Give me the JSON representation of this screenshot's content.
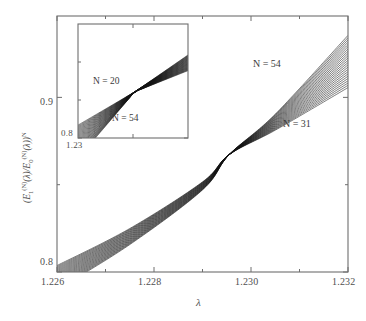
{
  "figure": {
    "type": "scientific-line-plot",
    "background": "#ffffff",
    "line_color": "#1a1a1a",
    "frame_color": "#6e6e6e"
  },
  "main_plot": {
    "xlabel": "λ",
    "ylabel_parts": {
      "open": "(E",
      "sub1": "1",
      "sup1": "(N)",
      "mid1": "(λ)/E",
      "sub2": "0",
      "sup2": "(N)",
      "mid2": "(λ))",
      "sup3": "N"
    },
    "ylabel_plain": "(E1(N)(λ)/E0(N)(λ))N",
    "x_ticks": [
      "1.226",
      "1.228",
      "1.230",
      "1.232"
    ],
    "y_ticks": [
      "0.9",
      "0.8"
    ],
    "annotations": [
      {
        "text": "N = 54",
        "position": "upper-right"
      },
      {
        "text": "N = 31",
        "position": "lower-right"
      }
    ]
  },
  "inset_plot": {
    "x_ticks": [
      "1.23"
    ],
    "y_ticks": [
      "0.8"
    ],
    "annotations": [
      {
        "text": "N = 20",
        "position": "left"
      },
      {
        "text": "N = 54",
        "position": "lower-center"
      }
    ]
  },
  "chart_data": {
    "type": "line",
    "title": "",
    "xlabel": "λ",
    "ylabel": "(E_1^(N)(λ)/E_0^(N)(λ))^N",
    "xlim": [
      1.226,
      1.232
    ],
    "ylim": [
      0.8,
      0.9466
    ],
    "xticks": [
      1.226,
      1.228,
      1.23,
      1.232
    ],
    "xticklabels": [
      "1.226",
      "1.228",
      "1.230",
      "1.232"
    ],
    "yticks": [
      0.8,
      0.9
    ],
    "yticklabels": [
      "0.8",
      "0.9"
    ],
    "grid": false,
    "legend": "none",
    "annotations": [
      {
        "text": "N = 54",
        "x": 1.2302,
        "y": 0.9225
      },
      {
        "text": "N = 31",
        "x": 1.2307,
        "y": 0.8855
      }
    ],
    "crossing_point": {
      "x": 1.22955,
      "y": 0.8672
    },
    "series": [
      {
        "name": "N = 31",
        "x": [
          1.226,
          1.2275,
          1.229,
          1.22955,
          1.2305,
          1.232
        ],
        "values": [
          0.8037,
          0.8249,
          0.8516,
          0.8672,
          0.8812,
          0.9056
        ]
      },
      {
        "name": "N = 32",
        "x": [
          1.226,
          1.2275,
          1.229,
          1.22955,
          1.2305,
          1.232
        ],
        "values": [
          0.8031,
          0.8245,
          0.8514,
          0.8672,
          0.8816,
          0.9069
        ]
      },
      {
        "name": "N = 33",
        "x": [
          1.226,
          1.2275,
          1.229,
          1.22955,
          1.2305,
          1.232
        ],
        "values": [
          0.8025,
          0.8241,
          0.8512,
          0.8672,
          0.882,
          0.9082
        ]
      },
      {
        "name": "N = 34",
        "x": [
          1.226,
          1.2275,
          1.229,
          1.22955,
          1.2305,
          1.232
        ],
        "values": [
          0.8019,
          0.8237,
          0.851,
          0.8672,
          0.8824,
          0.9095
        ]
      },
      {
        "name": "N = 35",
        "x": [
          1.226,
          1.2275,
          1.229,
          1.22955,
          1.2305,
          1.232
        ],
        "values": [
          0.8013,
          0.8233,
          0.8508,
          0.8672,
          0.8828,
          0.9108
        ]
      },
      {
        "name": "N = 36",
        "x": [
          1.226,
          1.2275,
          1.229,
          1.22955,
          1.2305,
          1.232
        ],
        "values": [
          0.8007,
          0.8229,
          0.8506,
          0.8672,
          0.8832,
          0.9121
        ]
      },
      {
        "name": "N = 37",
        "x": [
          1.226,
          1.2275,
          1.229,
          1.22955,
          1.2305,
          1.232
        ],
        "values": [
          0.8001,
          0.8225,
          0.8504,
          0.8672,
          0.8836,
          0.9134
        ]
      },
      {
        "name": "N = 38",
        "x": [
          1.226,
          1.2275,
          1.229,
          1.22955,
          1.2305,
          1.232
        ],
        "values": [
          0.7995,
          0.8221,
          0.8502,
          0.8672,
          0.884,
          0.9147
        ]
      },
      {
        "name": "N = 39",
        "x": [
          1.226,
          1.2275,
          1.229,
          1.22955,
          1.2305,
          1.232
        ],
        "values": [
          0.7989,
          0.8217,
          0.85,
          0.8672,
          0.8844,
          0.916
        ]
      },
      {
        "name": "N = 40",
        "x": [
          1.226,
          1.2275,
          1.229,
          1.22955,
          1.2305,
          1.232
        ],
        "values": [
          0.7983,
          0.8213,
          0.8498,
          0.8672,
          0.8848,
          0.9173
        ]
      },
      {
        "name": "N = 41",
        "x": [
          1.226,
          1.2275,
          1.229,
          1.22955,
          1.2305,
          1.232
        ],
        "values": [
          0.7977,
          0.8209,
          0.8496,
          0.8672,
          0.8852,
          0.9186
        ]
      },
      {
        "name": "N = 42",
        "x": [
          1.226,
          1.2275,
          1.229,
          1.22955,
          1.2305,
          1.232
        ],
        "values": [
          0.7971,
          0.8205,
          0.8494,
          0.8672,
          0.8856,
          0.9199
        ]
      },
      {
        "name": "N = 43",
        "x": [
          1.226,
          1.2275,
          1.229,
          1.22955,
          1.2305,
          1.232
        ],
        "values": [
          0.7965,
          0.8201,
          0.8492,
          0.8672,
          0.886,
          0.9212
        ]
      },
      {
        "name": "N = 44",
        "x": [
          1.226,
          1.2275,
          1.229,
          1.22955,
          1.2305,
          1.232
        ],
        "values": [
          0.7959,
          0.8197,
          0.849,
          0.8672,
          0.8864,
          0.9225
        ]
      },
      {
        "name": "N = 45",
        "x": [
          1.226,
          1.2275,
          1.229,
          1.22955,
          1.2305,
          1.232
        ],
        "values": [
          0.7953,
          0.8193,
          0.8488,
          0.8672,
          0.8868,
          0.9238
        ]
      },
      {
        "name": "N = 46",
        "x": [
          1.226,
          1.2275,
          1.229,
          1.22955,
          1.2305,
          1.232
        ],
        "values": [
          0.7947,
          0.8189,
          0.8486,
          0.8672,
          0.8872,
          0.9251
        ]
      },
      {
        "name": "N = 47",
        "x": [
          1.226,
          1.2275,
          1.229,
          1.22955,
          1.2305,
          1.232
        ],
        "values": [
          0.7941,
          0.8185,
          0.8484,
          0.8672,
          0.8876,
          0.9264
        ]
      },
      {
        "name": "N = 48",
        "x": [
          1.226,
          1.2275,
          1.229,
          1.22955,
          1.2305,
          1.232
        ],
        "values": [
          0.7935,
          0.8181,
          0.8482,
          0.8672,
          0.888,
          0.9277
        ]
      },
      {
        "name": "N = 49",
        "x": [
          1.226,
          1.2275,
          1.229,
          1.22955,
          1.2305,
          1.232
        ],
        "values": [
          0.7929,
          0.8177,
          0.848,
          0.8672,
          0.8884,
          0.929
        ]
      },
      {
        "name": "N = 50",
        "x": [
          1.226,
          1.2275,
          1.229,
          1.22955,
          1.2305,
          1.232
        ],
        "values": [
          0.7923,
          0.8173,
          0.8478,
          0.8672,
          0.8888,
          0.9303
        ]
      },
      {
        "name": "N = 51",
        "x": [
          1.226,
          1.2275,
          1.229,
          1.22955,
          1.2305,
          1.232
        ],
        "values": [
          0.7917,
          0.8169,
          0.8476,
          0.8672,
          0.8892,
          0.9316
        ]
      },
      {
        "name": "N = 52",
        "x": [
          1.226,
          1.2275,
          1.229,
          1.22955,
          1.2305,
          1.232
        ],
        "values": [
          0.7911,
          0.8165,
          0.8474,
          0.8672,
          0.8896,
          0.9329
        ]
      },
      {
        "name": "N = 53",
        "x": [
          1.226,
          1.2275,
          1.229,
          1.22955,
          1.2305,
          1.232
        ],
        "values": [
          0.7905,
          0.8161,
          0.8472,
          0.8672,
          0.89,
          0.9342
        ]
      },
      {
        "name": "N = 54",
        "x": [
          1.226,
          1.2275,
          1.229,
          1.22955,
          1.2305,
          1.232
        ],
        "values": [
          0.7899,
          0.8157,
          0.847,
          0.8672,
          0.8904,
          0.9355
        ]
      }
    ],
    "inset": {
      "type": "line",
      "xlim": [
        1.2285,
        1.2315
      ],
      "ylim": [
        0.8,
        0.98
      ],
      "xticks": [
        1.23
      ],
      "xticklabels": [
        "1.23"
      ],
      "yticks": [
        0.8
      ],
      "yticklabels": [
        "0.8"
      ],
      "grid": false,
      "annotations": [
        {
          "text": "N = 20",
          "x": 1.2292,
          "y": 0.893
        },
        {
          "text": "N = 54",
          "x": 1.23,
          "y": 0.842
        }
      ],
      "crossing_point": {
        "x": 1.23005,
        "y": 0.873
      },
      "description": "Zoomed-out view over a wider λ range showing curves for N = 20 through N = 54 fanning out on both sides of a common crossing point."
    }
  }
}
